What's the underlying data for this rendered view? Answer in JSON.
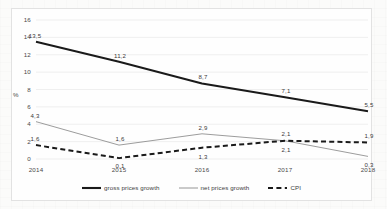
{
  "chart_data": {
    "type": "line",
    "title": "",
    "xlabel": "",
    "ylabel": "%",
    "categories": [
      "2014",
      "2015",
      "2016",
      "2017",
      "2018"
    ],
    "ylim": [
      0,
      16
    ],
    "ytick_step": 2,
    "yticks": [
      "16",
      "14",
      "12",
      "10",
      "8",
      "6",
      "4",
      "2",
      "0"
    ],
    "grid": "horizontal",
    "legend_position": "bottom",
    "decimal_separator": ",",
    "series": [
      {
        "name": "gross prices growth",
        "style": "solid-thick-black",
        "color": "#1a1a1a",
        "values": [
          13.5,
          11.2,
          8.7,
          7.1,
          5.5
        ],
        "labels": [
          "13,5",
          "11,2",
          "8,7",
          "7,1",
          "5,5"
        ]
      },
      {
        "name": "net prices growth",
        "style": "solid-thin-gray",
        "color": "#8a8a8a",
        "values": [
          4.3,
          1.6,
          2.9,
          2.1,
          0.3
        ],
        "labels": [
          "4,3",
          "1,6",
          "2,9",
          "2,1",
          "0,3"
        ]
      },
      {
        "name": "CPI",
        "style": "dashed-thick-black",
        "color": "#1a1a1a",
        "values": [
          1.6,
          0.1,
          1.3,
          2.1,
          1.9
        ],
        "labels": [
          "1,6",
          "0,1",
          "1,3",
          "2,1",
          "1,9"
        ]
      }
    ]
  },
  "legend": {
    "items": [
      {
        "label": "gross prices growth"
      },
      {
        "label": "net prices growth"
      },
      {
        "label": "CPI"
      }
    ]
  }
}
